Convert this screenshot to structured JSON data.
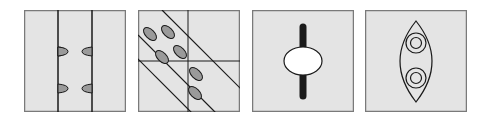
{
  "colors": {
    "panel_fill": "#e4e4e4",
    "panel_border": "#7a7a7a",
    "line": "#1a1a1a",
    "ellipse_fill": "#9a9a9a",
    "white": "#ffffff"
  },
  "panels": [
    {
      "id": "panel-1",
      "description": "three vertical strips with paired half-ellipses on the inner dividers"
    },
    {
      "id": "panel-2",
      "description": "diagonal band crossing a 2x2 grid with six grey ellipses"
    },
    {
      "id": "panel-3",
      "description": "white ellipse on a thick black vertical bar"
    },
    {
      "id": "panel-4",
      "description": "vesica shape containing two concentric circles"
    }
  ]
}
